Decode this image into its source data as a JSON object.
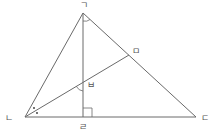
{
  "diagram": {
    "type": "geometry-triangle",
    "points": {
      "A": {
        "label": "ㄱ",
        "x": 83,
        "y": 13,
        "lx": 80,
        "ly": 8
      },
      "B": {
        "label": "ㄴ",
        "x": 25,
        "y": 117,
        "lx": 5,
        "ly": 121
      },
      "C": {
        "label": "ㄷ",
        "x": 196,
        "y": 117,
        "lx": 201,
        "ly": 121
      },
      "D": {
        "label": "ㄹ",
        "x": 83,
        "y": 117,
        "lx": 79,
        "ly": 130
      },
      "E": {
        "label": "ㅁ",
        "x": 129,
        "y": 55,
        "lx": 132,
        "ly": 54
      },
      "F": {
        "label": "ㅂ",
        "x": 83,
        "y": 82,
        "lx": 87,
        "ly": 88
      }
    },
    "segments": [
      [
        "A",
        "B"
      ],
      [
        "A",
        "C"
      ],
      [
        "B",
        "C"
      ],
      [
        "A",
        "D"
      ],
      [
        "B",
        "E"
      ]
    ],
    "marks": {
      "right_angle_at": "ㄹ",
      "angle_arc_at_apex": "ㄱ",
      "angle_arc_at_intersection": "ㅂ",
      "bisector_dots_at": "ㄴ"
    }
  }
}
